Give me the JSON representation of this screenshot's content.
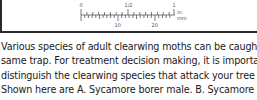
{
  "figure": {
    "ruler": {
      "inch_labels": [
        "0",
        "1/2",
        "1"
      ],
      "mm_labels": [
        "10",
        "20"
      ],
      "unit_in": "in.",
      "unit_mm": "mm"
    }
  },
  "paragraph": {
    "lines": [
      "Various species of adult clearwing moths can be caught in the",
      "same trap. For treatment decision making, it is important to",
      "distinguish the clearwing species that attack your tree species.",
      "Shown here are A. Sycamore borer male. B. Sycamore borer"
    ]
  }
}
